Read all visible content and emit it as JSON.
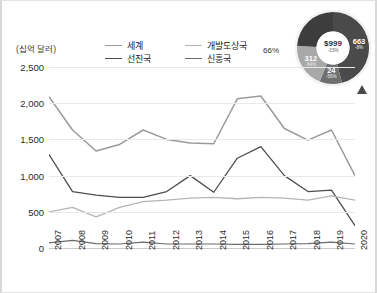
{
  "axis_unit_label": "(십억 달러)",
  "legend": [
    {
      "label": "세계",
      "color": "#9a9a9a"
    },
    {
      "label": "개발도상국",
      "color": "#b5b5b5"
    },
    {
      "label": "선진국",
      "color": "#4d4d4d"
    },
    {
      "label": "신흥국",
      "color": "#6b6b6b"
    }
  ],
  "marker_icon": "triangle-marker",
  "donut": {
    "outside_label": "66%",
    "center_value": "$999",
    "center_pct": "-33%",
    "segments": [
      {
        "name": "segment-663",
        "value": "663",
        "pct": "-8%",
        "share": 0.46,
        "color": "#4a4a4a"
      },
      {
        "name": "segment-24",
        "value": "24",
        "pct": "-56%",
        "share": 0.1,
        "color": "#6f6f6f"
      },
      {
        "name": "segment-312",
        "value": "312",
        "pct": "-64%",
        "share": 0.2,
        "color": "#a8a8a8"
      },
      {
        "name": "segment-lower",
        "value": "",
        "pct": "",
        "share": 0.24,
        "color": "#3d3d3d"
      }
    ]
  },
  "chart_data": {
    "type": "line",
    "title": "",
    "xlabel": "",
    "ylabel": "(십억 달러)",
    "ylim": [
      0,
      2500
    ],
    "yticks": [
      0,
      500,
      1000,
      1500,
      2000,
      2500
    ],
    "ytick_labels": [
      "0",
      "500",
      "1,000",
      "1,500",
      "2,000",
      "2,500"
    ],
    "grid": true,
    "legend_position": "top",
    "categories": [
      "2007",
      "2008",
      "2009",
      "2010",
      "2011",
      "2012",
      "2013",
      "2014",
      "2015",
      "2016",
      "2017",
      "2018",
      "2019",
      "2020"
    ],
    "series": [
      {
        "name": "세계",
        "color": "#9a9a9a",
        "width": 1.5,
        "values": [
          2090,
          1630,
          1340,
          1430,
          1630,
          1500,
          1450,
          1440,
          2060,
          2100,
          1650,
          1490,
          1630,
          1000
        ]
      },
      {
        "name": "선진국",
        "color": "#4d4d4d",
        "width": 1.3,
        "values": [
          1290,
          780,
          730,
          700,
          700,
          780,
          1000,
          770,
          1240,
          1400,
          1000,
          780,
          800,
          310
        ]
      },
      {
        "name": "개발도상국",
        "color": "#b5b5b5",
        "width": 1.3,
        "values": [
          500,
          560,
          430,
          560,
          640,
          660,
          690,
          700,
          680,
          700,
          690,
          660,
          720,
          660
        ]
      },
      {
        "name": "신흥국",
        "color": "#6b6b6b",
        "width": 1.2,
        "values": [
          70,
          105,
          60,
          55,
          80,
          55,
          55,
          55,
          50,
          50,
          55,
          60,
          80,
          55
        ]
      }
    ]
  }
}
